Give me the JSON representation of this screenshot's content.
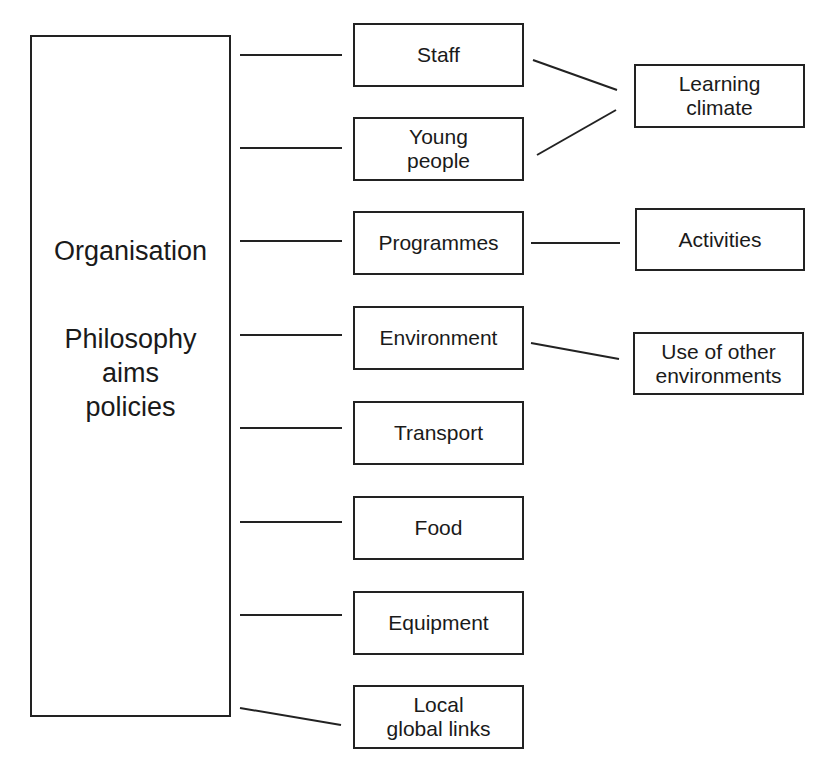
{
  "organisation": {
    "title": "Organisation",
    "lines": [
      "Philosophy",
      "aims",
      "policies"
    ]
  },
  "nodes": [
    {
      "id": "staff",
      "label": "Staff"
    },
    {
      "id": "young-people",
      "label": "Young people",
      "lines": [
        "Young",
        "people"
      ]
    },
    {
      "id": "programmes",
      "label": "Programmes"
    },
    {
      "id": "environment",
      "label": "Environment"
    },
    {
      "id": "transport",
      "label": "Transport"
    },
    {
      "id": "food",
      "label": "Food"
    },
    {
      "id": "equipment",
      "label": "Equipment"
    },
    {
      "id": "local-global-links",
      "label": "Local global links",
      "lines": [
        "Local",
        "global links"
      ]
    }
  ],
  "outcomes": [
    {
      "id": "learning-climate",
      "lines": [
        "Learning",
        "climate"
      ],
      "from": [
        "staff",
        "young-people"
      ]
    },
    {
      "id": "activities",
      "label": "Activities",
      "from": [
        "programmes"
      ]
    },
    {
      "id": "use-of-other-environments",
      "lines": [
        "Use of other",
        "environments"
      ],
      "from": [
        "environment"
      ]
    }
  ]
}
